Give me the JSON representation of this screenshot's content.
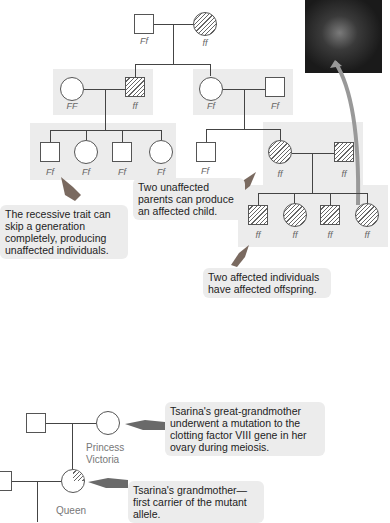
{
  "pedigree": {
    "gen1": [
      {
        "sex": "male",
        "genotype": "Ff",
        "affected": false
      },
      {
        "sex": "female",
        "genotype": "ff",
        "affected": true
      }
    ],
    "gen2_left": [
      {
        "sex": "female",
        "genotype": "FF",
        "affected": false
      },
      {
        "sex": "male",
        "genotype": "ff",
        "affected": true
      }
    ],
    "gen2_right": [
      {
        "sex": "female",
        "genotype": "Ff",
        "affected": false
      },
      {
        "sex": "male",
        "genotype": "Ff",
        "affected": false
      }
    ],
    "gen3_left": [
      {
        "sex": "male",
        "genotype": "Ff"
      },
      {
        "sex": "female",
        "genotype": "Ff"
      },
      {
        "sex": "male",
        "genotype": "Ff"
      },
      {
        "sex": "female",
        "genotype": "Ff"
      }
    ],
    "gen3_right": [
      {
        "sex": "male",
        "genotype": "Ff",
        "affected": false
      },
      {
        "sex": "female",
        "genotype": "ff",
        "affected": true
      },
      {
        "sex": "male",
        "genotype": "ff",
        "affected": true
      }
    ],
    "gen4": [
      {
        "sex": "male",
        "genotype": "ff"
      },
      {
        "sex": "female",
        "genotype": "ff"
      },
      {
        "sex": "male",
        "genotype": "ff"
      },
      {
        "sex": "female",
        "genotype": "ff"
      }
    ]
  },
  "notes": {
    "skip": "The recessive trait can skip a generation completely, producing unaffected individuals.",
    "unaffected_parents": "Two unaffected parents can produce an affected child.",
    "affected_parents": "Two affected individuals have affected offspring.",
    "great_grandmother": "Tsarina's great-grandmother underwent a mutation to the clotting factor VIII gene in her ovary during meiosis.",
    "grandmother": "Tsarina's grandmother—first carrier of the mutant allele."
  },
  "labels": {
    "princess": "Princess Victoria",
    "queen": "Queen"
  },
  "image": {
    "subject": "ear-photo"
  }
}
